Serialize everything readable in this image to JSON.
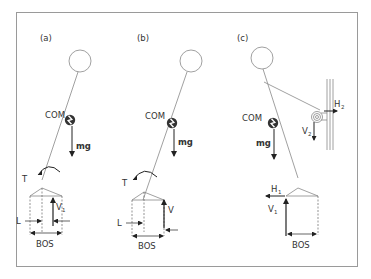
{
  "figure": {
    "frame_color": "#9a9a9a",
    "line_color": "#888888",
    "arrow_color": "#222222",
    "text_color": "#333333"
  },
  "panels": [
    {
      "id": "a",
      "label": "(a)",
      "com_label": "COM",
      "gravity_label": "mg",
      "torque_label": "T",
      "vertical_force_label": "V",
      "vertical_force_sub": "1",
      "lever_label": "L",
      "base_label": "BOS"
    },
    {
      "id": "b",
      "label": "(b)",
      "com_label": "COM",
      "gravity_label": "mg",
      "torque_label": "T",
      "vertical_force_label": "V",
      "lever_label": "L",
      "base_label": "BOS"
    },
    {
      "id": "c",
      "label": "(c)",
      "com_label": "COM",
      "gravity_label": "mg",
      "horizontal_force_1": "H",
      "horizontal_force_1_sub": "1",
      "vertical_force_1": "V",
      "vertical_force_1_sub": "1",
      "horizontal_force_2": "H",
      "horizontal_force_2_sub": "2",
      "vertical_force_2": "V",
      "vertical_force_2_sub": "2",
      "base_label": "BOS"
    }
  ]
}
